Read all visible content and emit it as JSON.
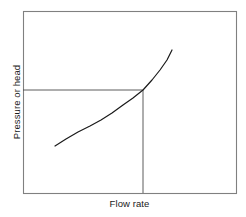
{
  "figure": {
    "background": "#ffffff",
    "frame": {
      "x0": 23,
      "y0": 11,
      "x1": 236,
      "y1": 193,
      "color": "#808080",
      "width": 1.1
    },
    "axes": {
      "ylabel": "Pressure or head",
      "xlabel": "Flow rate",
      "label_color": "#1a1a1a"
    }
  },
  "chart_data": {
    "type": "line",
    "title": "",
    "xlabel": "Flow rate",
    "ylabel": "Pressure or head",
    "xlim": [
      23,
      236
    ],
    "ylim": [
      193,
      11
    ],
    "grid": false,
    "legend": null,
    "tick_labels": {
      "x": [],
      "y": []
    },
    "series": [
      {
        "name": "system-curve",
        "color": "#1a1a1a",
        "width": 1.2,
        "points": [
          [
            55,
            146
          ],
          [
            66,
            139
          ],
          [
            78,
            132
          ],
          [
            90,
            126
          ],
          [
            101,
            120
          ],
          [
            112,
            113
          ],
          [
            123,
            105
          ],
          [
            133,
            98
          ],
          [
            143,
            90
          ],
          [
            152,
            80
          ],
          [
            160,
            70
          ],
          [
            167,
            60
          ],
          [
            172,
            50
          ]
        ]
      }
    ],
    "annotations": [
      {
        "name": "operating-point",
        "x": 143,
        "y": 90,
        "horizontal_line": {
          "from_x": 23,
          "to_x": 143,
          "y": 90
        },
        "vertical_line": {
          "x": 143,
          "from_y": 90,
          "to_y": 193
        },
        "color": "#4a4a4a",
        "width": 0.9
      }
    ]
  }
}
